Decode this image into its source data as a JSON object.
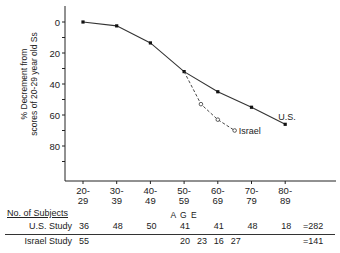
{
  "chart_data": {
    "type": "line",
    "title": "",
    "xlabel": "A G E",
    "ylabel": "% Decrement from scores of 20-29 year old Ss",
    "ylabel_lines": [
      "% Decrement from",
      "scores of 20-29 year old Ss"
    ],
    "y_ticks": [
      0,
      20,
      40,
      60,
      80
    ],
    "ylim": [
      0,
      95
    ],
    "y_inverted": true,
    "grid": false,
    "categories": [
      "20-29",
      "30-39",
      "40-49",
      "50-59",
      "60-69",
      "70-79",
      "80-89"
    ],
    "category_labels": [
      [
        "20-",
        "29"
      ],
      [
        "30-",
        "39"
      ],
      [
        "40-",
        "49"
      ],
      [
        "50-",
        "59"
      ],
      [
        "60-",
        "69"
      ],
      [
        "70-",
        "79"
      ],
      [
        "80-",
        "89"
      ]
    ],
    "series": [
      {
        "name": "U.S.",
        "style": "solid",
        "marker": "filled-square",
        "x": [
          0,
          1,
          2,
          3,
          4,
          5,
          6
        ],
        "values": [
          0,
          2.5,
          13.5,
          32,
          45,
          55,
          66
        ]
      },
      {
        "name": "Israel",
        "style": "dashed",
        "marker": "open-circle",
        "x": [
          3,
          3.5,
          4,
          4.5
        ],
        "values": [
          32,
          53,
          63,
          70
        ]
      }
    ],
    "legend": "inline labels at series ends"
  },
  "table": {
    "heading": "No. of Subjects",
    "rows": [
      {
        "label": "U.S. Study",
        "cells": [
          {
            "x": 0,
            "value": "36"
          },
          {
            "x": 1,
            "value": "48"
          },
          {
            "x": 2,
            "value": "50"
          },
          {
            "x": 3,
            "value": "41"
          },
          {
            "x": 4,
            "value": "41"
          },
          {
            "x": 5,
            "value": "48"
          },
          {
            "x": 6,
            "value": "18"
          }
        ],
        "total": "=282"
      },
      {
        "label": "Israel Study",
        "cells": [
          {
            "x": 0,
            "value": "55"
          },
          {
            "x": 3,
            "value": "20"
          },
          {
            "x": 3.5,
            "value": "23"
          },
          {
            "x": 4,
            "value": "16"
          },
          {
            "x": 4.5,
            "value": "27"
          }
        ],
        "total": "=141"
      }
    ]
  }
}
